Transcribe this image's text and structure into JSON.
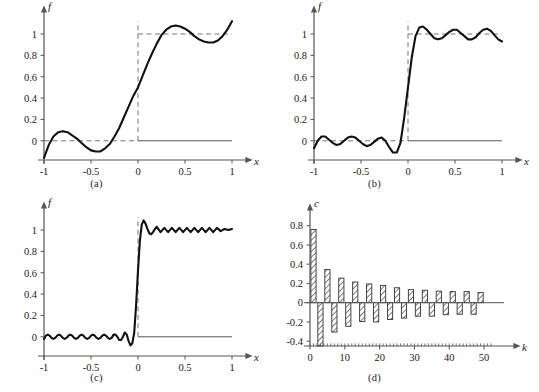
{
  "figure": {
    "curve_color": "#111111",
    "axis_color": "#555555",
    "dash_color": "#777777",
    "bar_edge_color": "#333333",
    "bar_hatch_color": "#666666"
  },
  "panels": [
    {
      "id": "a",
      "caption": "(a)"
    },
    {
      "id": "b",
      "caption": "(b)"
    },
    {
      "id": "c",
      "caption": "(c)"
    },
    {
      "id": "d",
      "caption": "(d)"
    }
  ],
  "chart_data": [
    {
      "type": "line",
      "panel": "a",
      "title": "",
      "xlabel": "x",
      "ylabel": "f",
      "xlim": [
        -1,
        1
      ],
      "ylim": [
        -0.18,
        1.15
      ],
      "xticks": [
        -1,
        -0.5,
        0,
        0.5,
        1
      ],
      "xticklabels": [
        "-1",
        "-0.5",
        "0",
        "0.5",
        "1"
      ],
      "yticks": [
        0,
        0.2,
        0.4,
        0.6,
        0.8,
        1
      ],
      "yticklabels": [
        "0",
        "0.2",
        "0.4",
        "0.6",
        "0.8",
        "1"
      ],
      "grid": false,
      "reference_lines": [
        {
          "kind": "dashed-horizontal",
          "y": 0,
          "x_from": -1,
          "x_to": 0
        },
        {
          "kind": "dashed-horizontal",
          "y": 1,
          "x_from": 0,
          "x_to": 1
        },
        {
          "kind": "dashed-vertical",
          "x": 0,
          "y_from": 0,
          "y_to": 1.12
        },
        {
          "kind": "solid-horizontal",
          "y": 0,
          "x_from": 0,
          "x_to": 1
        }
      ],
      "series": [
        {
          "name": "partial sum N=1",
          "x": [
            -1.0,
            -0.95,
            -0.9,
            -0.85,
            -0.8,
            -0.75,
            -0.7,
            -0.65,
            -0.6,
            -0.55,
            -0.5,
            -0.45,
            -0.4,
            -0.35,
            -0.3,
            -0.25,
            -0.2,
            -0.15,
            -0.1,
            -0.05,
            0.0,
            0.05,
            0.1,
            0.15,
            0.2,
            0.25,
            0.3,
            0.35,
            0.4,
            0.45,
            0.5,
            0.55,
            0.6,
            0.65,
            0.7,
            0.75,
            0.8,
            0.85,
            0.9,
            0.95,
            1.0
          ],
          "y": [
            -0.16,
            -0.04,
            0.04,
            0.08,
            0.09,
            0.08,
            0.05,
            0.02,
            -0.02,
            -0.06,
            -0.09,
            -0.1,
            -0.1,
            -0.07,
            -0.03,
            0.04,
            0.12,
            0.22,
            0.32,
            0.42,
            0.5,
            0.61,
            0.72,
            0.82,
            0.91,
            0.99,
            1.04,
            1.07,
            1.08,
            1.07,
            1.05,
            1.02,
            0.98,
            0.95,
            0.93,
            0.92,
            0.92,
            0.94,
            0.98,
            1.04,
            1.12
          ]
        }
      ]
    },
    {
      "type": "line",
      "panel": "b",
      "title": "",
      "xlabel": "x",
      "ylabel": "f",
      "xlim": [
        -1,
        1
      ],
      "ylim": [
        -0.18,
        1.15
      ],
      "xticks": [
        -1,
        -0.5,
        0,
        0.5,
        1
      ],
      "xticklabels": [
        "-1",
        "-0.5",
        "0",
        "0.5",
        "1"
      ],
      "yticks": [
        0,
        0.2,
        0.4,
        0.6,
        0.8,
        1
      ],
      "yticklabels": [
        "0",
        "0.2",
        "0.4",
        "0.6",
        "0.8",
        "1"
      ],
      "grid": false,
      "reference_lines": [
        {
          "kind": "dashed-horizontal",
          "y": 0,
          "x_from": -1,
          "x_to": 0
        },
        {
          "kind": "dashed-horizontal",
          "y": 1,
          "x_from": 0,
          "x_to": 1
        },
        {
          "kind": "dashed-vertical",
          "x": 0,
          "y_from": 0,
          "y_to": 1.12
        },
        {
          "kind": "solid-horizontal",
          "y": 0,
          "x_from": 0,
          "x_to": 1
        }
      ],
      "series": [
        {
          "name": "partial sum N=4",
          "x": [
            -1.0,
            -0.96,
            -0.92,
            -0.88,
            -0.84,
            -0.8,
            -0.76,
            -0.72,
            -0.68,
            -0.64,
            -0.6,
            -0.56,
            -0.52,
            -0.48,
            -0.44,
            -0.4,
            -0.36,
            -0.32,
            -0.28,
            -0.24,
            -0.2,
            -0.16,
            -0.12,
            -0.08,
            -0.04,
            0.0,
            0.04,
            0.08,
            0.12,
            0.16,
            0.2,
            0.24,
            0.28,
            0.32,
            0.36,
            0.4,
            0.44,
            0.48,
            0.52,
            0.56,
            0.6,
            0.64,
            0.68,
            0.72,
            0.76,
            0.8,
            0.84,
            0.88,
            0.92,
            0.96,
            1.0
          ],
          "y": [
            -0.07,
            0.0,
            0.04,
            0.04,
            0.01,
            -0.02,
            -0.04,
            -0.03,
            0.0,
            0.03,
            0.04,
            0.03,
            0.0,
            -0.03,
            -0.05,
            -0.04,
            -0.01,
            0.02,
            0.03,
            0.0,
            -0.06,
            -0.11,
            -0.11,
            -0.02,
            0.22,
            0.5,
            0.78,
            0.98,
            1.06,
            1.07,
            1.04,
            1.0,
            0.96,
            0.95,
            0.96,
            0.99,
            1.02,
            1.04,
            1.04,
            1.01,
            0.98,
            0.95,
            0.95,
            0.97,
            1.01,
            1.04,
            1.05,
            1.03,
            0.99,
            0.95,
            0.93
          ]
        }
      ]
    },
    {
      "type": "line",
      "panel": "c",
      "title": "",
      "xlabel": "x",
      "ylabel": "f",
      "xlim": [
        -1,
        1
      ],
      "ylim": [
        -0.18,
        1.15
      ],
      "xticks": [
        -1,
        -0.5,
        0,
        0.5,
        1
      ],
      "xticklabels": [
        "-1",
        "-0.5",
        "0",
        "0.5",
        "1"
      ],
      "yticks": [
        0,
        0.2,
        0.4,
        0.6,
        0.8,
        1
      ],
      "yticklabels": [
        "0",
        "0.2",
        "0.4",
        "0.6",
        "0.8",
        "1"
      ],
      "grid": false,
      "reference_lines": [
        {
          "kind": "dashed-vertical",
          "x": 0,
          "y_from": 0,
          "y_to": 1.12
        },
        {
          "kind": "solid-horizontal",
          "y": 0,
          "x_from": 0,
          "x_to": 1
        }
      ],
      "series": [
        {
          "name": "partial sum N=13",
          "x": [
            -1.0,
            -0.98,
            -0.96,
            -0.94,
            -0.92,
            -0.9,
            -0.88,
            -0.86,
            -0.84,
            -0.82,
            -0.8,
            -0.78,
            -0.76,
            -0.74,
            -0.72,
            -0.7,
            -0.68,
            -0.66,
            -0.64,
            -0.62,
            -0.6,
            -0.58,
            -0.56,
            -0.54,
            -0.52,
            -0.5,
            -0.48,
            -0.46,
            -0.44,
            -0.42,
            -0.4,
            -0.38,
            -0.36,
            -0.34,
            -0.32,
            -0.3,
            -0.28,
            -0.26,
            -0.24,
            -0.22,
            -0.2,
            -0.18,
            -0.16,
            -0.14,
            -0.12,
            -0.1,
            -0.08,
            -0.06,
            -0.04,
            -0.02,
            0.0,
            0.02,
            0.04,
            0.06,
            0.08,
            0.1,
            0.12,
            0.14,
            0.16,
            0.18,
            0.2,
            0.24,
            0.28,
            0.32,
            0.36,
            0.4,
            0.44,
            0.48,
            0.52,
            0.56,
            0.6,
            0.64,
            0.68,
            0.72,
            0.76,
            0.8,
            0.84,
            0.88,
            0.92,
            0.96,
            1.0
          ],
          "y": [
            -0.02,
            0.01,
            0.02,
            0.01,
            -0.01,
            -0.02,
            -0.01,
            0.01,
            0.02,
            0.01,
            -0.01,
            -0.02,
            -0.01,
            0.01,
            0.02,
            0.01,
            -0.01,
            -0.02,
            -0.01,
            0.01,
            0.02,
            0.01,
            -0.01,
            -0.02,
            -0.01,
            0.01,
            0.02,
            0.01,
            -0.01,
            -0.02,
            -0.01,
            0.01,
            0.02,
            0.01,
            -0.01,
            -0.02,
            -0.01,
            0.02,
            0.02,
            0.0,
            -0.03,
            -0.03,
            0.0,
            0.04,
            0.02,
            -0.04,
            -0.08,
            -0.06,
            0.04,
            0.3,
            0.62,
            0.9,
            1.05,
            1.09,
            1.06,
            1.01,
            0.97,
            0.96,
            0.98,
            1.01,
            1.03,
            0.98,
            1.02,
            0.98,
            1.02,
            0.98,
            1.02,
            0.98,
            1.02,
            0.98,
            1.02,
            0.98,
            1.02,
            0.98,
            1.02,
            0.98,
            1.02,
            0.99,
            1.01,
            1.0,
            1.01
          ]
        }
      ]
    },
    {
      "type": "bar",
      "panel": "d",
      "title": "",
      "xlabel": "k",
      "ylabel": "c",
      "xlim": [
        0,
        54
      ],
      "ylim": [
        -0.45,
        0.88
      ],
      "xticks": [
        0,
        10,
        20,
        30,
        40,
        50
      ],
      "xticklabels": [
        "0",
        "10",
        "20",
        "30",
        "40",
        "50"
      ],
      "yticks": [
        -0.4,
        -0.2,
        0,
        0.2,
        0.4,
        0.6,
        0.8
      ],
      "yticklabels": [
        "-0.4",
        "-0.2",
        "0",
        "0.2",
        "0.4",
        "0.6",
        "0.8"
      ],
      "grid": false,
      "bar_style": "hatched-diagonal",
      "categories": [
        1,
        3,
        5,
        7,
        9,
        11,
        13,
        15,
        17,
        19,
        21,
        23,
        25,
        27,
        29,
        31,
        33,
        35,
        37,
        39,
        41,
        43,
        45,
        47,
        49
      ],
      "values": [
        0.76,
        -0.45,
        0.345,
        -0.305,
        0.255,
        -0.245,
        0.215,
        -0.195,
        0.195,
        -0.2,
        0.18,
        -0.175,
        0.155,
        -0.16,
        0.135,
        -0.14,
        0.13,
        -0.14,
        0.12,
        -0.125,
        0.115,
        -0.12,
        0.115,
        -0.12,
        0.105
      ]
    }
  ]
}
